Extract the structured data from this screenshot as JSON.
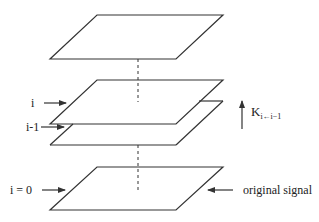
{
  "diagram": {
    "type": "image-pyramid-layers",
    "colors": {
      "line": "#333333",
      "background": "#ffffff"
    },
    "planes": [
      {
        "id": "top",
        "label": ""
      },
      {
        "id": "level-i",
        "label": "i"
      },
      {
        "id": "level-i-minus-1",
        "label": "i-1"
      },
      {
        "id": "level-0",
        "label": "i = 0"
      }
    ],
    "labels": {
      "level_i": "i",
      "level_i_minus_1": "i-1",
      "level_0": "i = 0",
      "original_signal": "original signal",
      "kernel_base": "K",
      "kernel_subscript": "i←i−1"
    }
  }
}
